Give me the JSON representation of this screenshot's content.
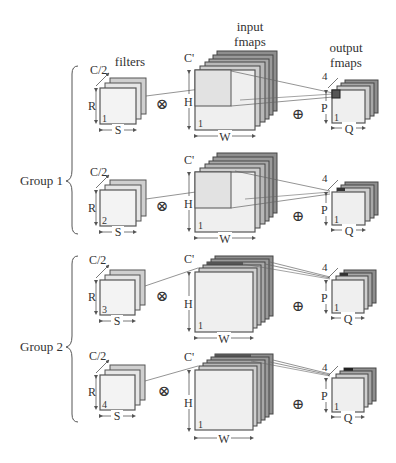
{
  "titles": {
    "filters": "filters",
    "input_line1": "input",
    "input_line2": "fmaps",
    "output_line1": "output",
    "output_line2": "fmaps"
  },
  "groups": [
    {
      "label": "Group 1",
      "rows": [
        0,
        1
      ]
    },
    {
      "label": "Group 2",
      "rows": [
        2,
        3
      ]
    }
  ],
  "dims": {
    "filter_channels": "C/2",
    "filter_height": "R",
    "filter_width": "S",
    "input_channels": "C'",
    "input_height": "H",
    "input_width": "W",
    "input_index": "1",
    "output_channels": "4",
    "output_height": "P",
    "output_width": "Q",
    "output_index": "1"
  },
  "rows": [
    {
      "filter_index": "1",
      "op_multiply": "⊗",
      "op_add": "⊕",
      "highlight": "front-layer"
    },
    {
      "filter_index": "2",
      "op_multiply": "⊗",
      "op_add": "⊕",
      "highlight": "second-layer"
    },
    {
      "filter_index": "3",
      "op_multiply": "⊗",
      "op_add": "⊕",
      "highlight": "third-layer"
    },
    {
      "filter_index": "4",
      "op_multiply": "⊗",
      "op_add": "⊕",
      "highlight": "back-layer"
    }
  ],
  "colors": {
    "front_face": "#f1f1f1",
    "layer_mid": "#bdbdbd",
    "layer_dark": "#8a8a8a",
    "stroke": "#555555",
    "highlight": "#444444",
    "text": "#333333"
  }
}
